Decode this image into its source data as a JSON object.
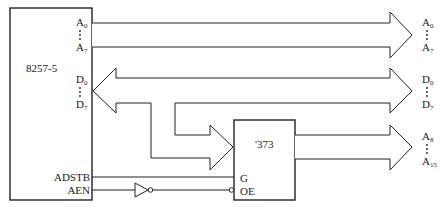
{
  "diagram": {
    "dma_chip": {
      "label": "8257-5",
      "pins": {
        "a_low_start": {
          "base": "A",
          "sub": "0"
        },
        "a_low_end": {
          "base": "A",
          "sub": "7"
        },
        "d_start": {
          "base": "D",
          "sub": "0"
        },
        "d_end": {
          "base": "D",
          "sub": "7"
        },
        "adstb": "ADSTB",
        "aen": "AEN"
      }
    },
    "latch_chip": {
      "label": "'373",
      "pins": {
        "g": "G",
        "oe": "OE"
      }
    },
    "outputs": {
      "addr_low": {
        "start": {
          "base": "A",
          "sub": "0"
        },
        "end": {
          "base": "A",
          "sub": "7"
        }
      },
      "data": {
        "start": {
          "base": "D",
          "sub": "0"
        },
        "end": {
          "base": "D",
          "sub": "7"
        }
      },
      "addr_high": {
        "start": {
          "base": "A",
          "sub": "8"
        },
        "end": {
          "base": "A",
          "sub": "15"
        }
      }
    },
    "gates": {
      "inverter": "NOT gate driving OE from AEN"
    }
  }
}
